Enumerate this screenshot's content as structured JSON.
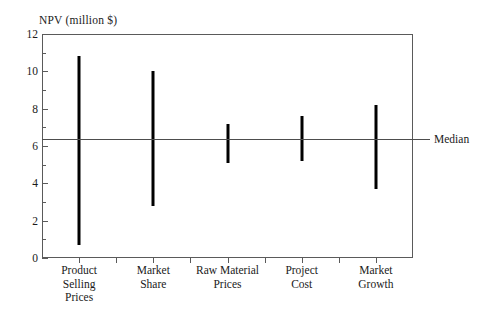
{
  "chart_data": {
    "type": "bar",
    "title": "NPV (million $)",
    "xlabel": "",
    "ylabel": "NPV (million $)",
    "ylim": [
      0,
      12
    ],
    "grid": false,
    "legend": null,
    "orientation": "vertical-range",
    "categories": [
      "Product Selling Prices",
      "Market Share",
      "Raw Material Prices",
      "Project Cost",
      "Market Growth"
    ],
    "category_lines": [
      [
        "Product",
        "Selling",
        "Prices"
      ],
      [
        "Market",
        "Share"
      ],
      [
        "Raw Material",
        "Prices"
      ],
      [
        "Project",
        "Cost"
      ],
      [
        "Market",
        "Growth"
      ]
    ],
    "series": [
      {
        "name": "NPV range",
        "low": [
          0.7,
          2.8,
          5.1,
          5.2,
          3.7
        ],
        "high": [
          10.8,
          10.0,
          7.2,
          7.6,
          8.2
        ]
      }
    ],
    "ytick_labels": [
      "0",
      "2",
      "4",
      "6",
      "8",
      "10",
      "12"
    ],
    "ytick_values": [
      0,
      2,
      4,
      6,
      8,
      10,
      12
    ],
    "yminor_values": [
      1,
      3,
      5,
      7,
      9,
      11
    ],
    "annotations": [
      {
        "label": "Median",
        "value": 6.4,
        "type": "reference-line"
      }
    ],
    "colors": {
      "bar": "#000000",
      "axis": "#5a5a5a",
      "median": "#4d4d4d",
      "background": "#ffffff",
      "text": "#1a1a1a"
    }
  }
}
